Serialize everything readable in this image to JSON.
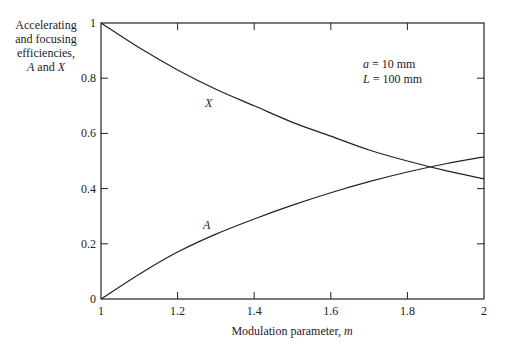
{
  "chart_data": {
    "type": "line",
    "title": "",
    "xlabel": "Modulation parameter, m",
    "ylabel": "Accelerating and focusing efficiencies, A and X",
    "ylabel_lines": [
      "Accelerating",
      "and focusing",
      "efficiencies,",
      "A and X"
    ],
    "xlim": [
      1,
      2
    ],
    "ylim": [
      0,
      1
    ],
    "xticks": [
      "1",
      "1.2",
      "1.4",
      "1.6",
      "1.8",
      "2"
    ],
    "yticks": [
      "0",
      "0.2",
      "0.4",
      "0.6",
      "0.8",
      "1"
    ],
    "grid": false,
    "annotations": [
      "a = 10 mm",
      "L = 100 mm"
    ],
    "x": [
      1.0,
      1.1,
      1.2,
      1.3,
      1.4,
      1.5,
      1.6,
      1.7,
      1.8,
      1.9,
      2.0
    ],
    "series": [
      {
        "name": "X",
        "values": [
          1.0,
          0.91,
          0.83,
          0.76,
          0.7,
          0.64,
          0.59,
          0.54,
          0.5,
          0.465,
          0.435
        ]
      },
      {
        "name": "A",
        "values": [
          0.0,
          0.09,
          0.17,
          0.235,
          0.29,
          0.34,
          0.385,
          0.425,
          0.46,
          0.49,
          0.515
        ]
      }
    ]
  },
  "labels": {
    "ylabel_1": "Accelerating",
    "ylabel_2": "and focusing",
    "ylabel_3": "efficiencies,",
    "ylabel_4a": "A",
    "ylabel_4b": " and ",
    "ylabel_4c": "X",
    "xlabel_main": "Modulation parameter, ",
    "xlabel_var": "m",
    "annot_a_var": "a",
    "annot_a_val": " = 10 mm",
    "annot_L_var": "L",
    "annot_L_val": " = 100 mm",
    "curve_X": "X",
    "curve_A": "A"
  }
}
